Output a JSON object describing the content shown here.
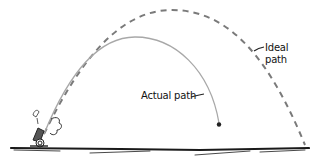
{
  "diagram": {
    "type": "projectile-trajectory-comparison",
    "labels": {
      "actual": "Actual path",
      "ideal_line1": "Ideal",
      "ideal_line2": "path",
      "cannon_sound": "BOOM"
    },
    "colors": {
      "actual_path": "#a8a8a8",
      "ideal_path": "#7a7a7a",
      "ground": "#1a1a1a",
      "ink": "#222222"
    },
    "elements": [
      {
        "id": "cannon",
        "desc": "small cannon firing at lower left with smoke puff"
      },
      {
        "id": "actual-path",
        "desc": "solid gray arc, shorter and lower, ending at a cannonball"
      },
      {
        "id": "ideal-path",
        "desc": "dashed gray arc, higher and longer, reaching ground at right"
      },
      {
        "id": "ground",
        "desc": "hand-drawn horizontal ground line"
      }
    ]
  }
}
